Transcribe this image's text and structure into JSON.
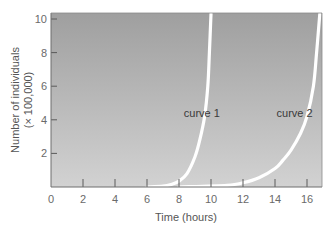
{
  "chart_data": {
    "type": "line",
    "title": "",
    "xlabel": "Time (hours)",
    "ylabel_lines": [
      "Number of individuals",
      "(× 100,000)"
    ],
    "ylabel": "Number of individuals (× 100,000)",
    "xlim": [
      0,
      17
    ],
    "ylim": [
      0,
      10.5
    ],
    "x_ticks": [
      0,
      2,
      4,
      6,
      8,
      10,
      12,
      14,
      16
    ],
    "x_tick_labels": [
      "0",
      "2",
      "4",
      "6",
      "8",
      "10",
      "12",
      "14",
      "16"
    ],
    "y_ticks": [
      2,
      4,
      6,
      8,
      10
    ],
    "y_tick_labels": [
      "2",
      "4",
      "6",
      "8",
      "10"
    ],
    "grid": false,
    "background": "gray vertical gradient",
    "series": [
      {
        "name": "curve 1",
        "label": "curve 1",
        "x": [
          6.0,
          7.0,
          7.5,
          8.0,
          8.5,
          9.0,
          9.3,
          9.6,
          9.8,
          9.9,
          10.0
        ],
        "y": [
          0.0,
          0.05,
          0.15,
          0.35,
          0.8,
          1.8,
          2.8,
          4.2,
          6.0,
          8.0,
          10.3
        ]
      },
      {
        "name": "curve 2",
        "label": "curve 2",
        "x": [
          8.0,
          11.0,
          12.0,
          13.0,
          14.0,
          14.5,
          15.0,
          15.6,
          16.0,
          16.4,
          16.6,
          16.8
        ],
        "y": [
          0.0,
          0.1,
          0.25,
          0.55,
          1.1,
          1.6,
          2.2,
          3.2,
          4.2,
          6.0,
          8.0,
          10.3
        ]
      }
    ],
    "annotations": [
      {
        "text": "curve 1",
        "x": 8.3,
        "y": 4.4
      },
      {
        "text": "curve 2",
        "x": 14.1,
        "y": 4.4
      }
    ],
    "colors": {
      "plot_bg_top": "#9f9f9f",
      "plot_bg_bottom": "#d2d2d2",
      "curve": "#ffffff",
      "axis": "#6f6f6f",
      "tick": "#5a5a5a"
    }
  }
}
